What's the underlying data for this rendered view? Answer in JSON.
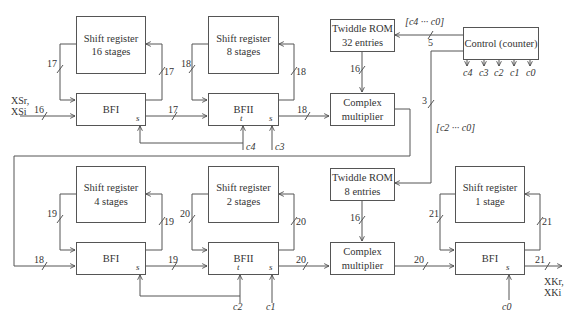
{
  "diagram": {
    "inputs": {
      "label_line1": "XSr,",
      "label_line2": "XSi",
      "width": "16"
    },
    "outputs": {
      "label_line1": "XKr,",
      "label_line2": "XKi",
      "width": "21"
    },
    "stage1": {
      "shift_register": {
        "label": "Shift register\n16 stages"
      },
      "butterfly": {
        "label": "BFI",
        "select": "s"
      },
      "feedback_in_width": "17",
      "feedback_out_width": "17",
      "out_width": "17"
    },
    "stage2": {
      "shift_register": {
        "label": "Shift register\n8 stages"
      },
      "butterfly": {
        "label": "BFII",
        "toggle": "t",
        "select": "s"
      },
      "feedback_in_width": "18",
      "feedback_out_width": "18",
      "out_width": "18",
      "control_t": "c4",
      "control_s": "c3"
    },
    "twiddle_rom_1": {
      "label": "Twiddle ROM\n32 entries",
      "out_width": "16",
      "addr_width": "5",
      "addr_label": "[c4 ··· c0]"
    },
    "multiplier_1": {
      "label": "Complex\nmultiplier"
    },
    "control": {
      "label": "Control (counter)",
      "outputs": [
        "c4",
        "c3",
        "c2",
        "c1",
        "c0"
      ],
      "bus_width": "3",
      "bus_label": "[c2 ··· c0]"
    },
    "stage3": {
      "shift_register": {
        "label": "Shift register\n4 stages"
      },
      "butterfly": {
        "label": "BFI",
        "select": "s"
      },
      "in_width": "18",
      "feedback_in_width": "19",
      "feedback_out_width": "19",
      "out_width": "19"
    },
    "stage4": {
      "shift_register": {
        "label": "Shift register\n2 stages"
      },
      "butterfly": {
        "label": "BFII",
        "toggle": "t",
        "select": "s"
      },
      "feedback_in_width": "20",
      "feedback_out_width": "20",
      "out_width": "20",
      "control_t": "c2",
      "control_s": "c1"
    },
    "twiddle_rom_2": {
      "label": "Twiddle ROM\n8 entries",
      "out_width": "16"
    },
    "multiplier_2": {
      "label": "Complex\nmultiplier",
      "out_width": "20"
    },
    "stage5": {
      "shift_register": {
        "label": "Shift register\n1 stage"
      },
      "butterfly": {
        "label": "BFI",
        "select": "s"
      },
      "feedback_in_width": "21",
      "feedback_out_width": "21",
      "control_s": "c0"
    }
  }
}
